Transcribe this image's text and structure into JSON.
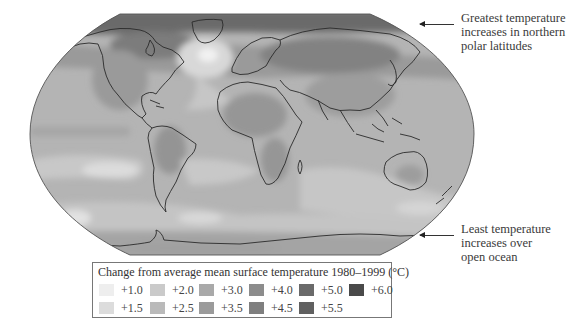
{
  "figure": {
    "type": "world-map",
    "projection": "pseudo-elliptical (flat poles)",
    "colors": {
      "ocean_base": "#b4b4b4",
      "coastline": "#2a2a2a",
      "map_border": "#555555"
    }
  },
  "annotations": {
    "top": {
      "lines": [
        "Greatest temperature",
        "increases in northern",
        "polar latitudes"
      ],
      "arrow": "left-arrow"
    },
    "bottom": {
      "lines": [
        "Least temperature",
        "increases over",
        "open ocean"
      ],
      "arrow": "left-arrow"
    }
  },
  "legend": {
    "title": "Change from average mean surface temperature 1980–1999 (°C)",
    "items": [
      {
        "label": "+1.0",
        "color": "#eeeeee"
      },
      {
        "label": "+1.5",
        "color": "#dcdcdc"
      },
      {
        "label": "+2.0",
        "color": "#cacaca"
      },
      {
        "label": "+2.5",
        "color": "#bababa"
      },
      {
        "label": "+3.0",
        "color": "#a9a9a9"
      },
      {
        "label": "+3.5",
        "color": "#9b9b9b"
      },
      {
        "label": "+4.0",
        "color": "#8c8c8c"
      },
      {
        "label": "+4.5",
        "color": "#7f7f7f"
      },
      {
        "label": "+5.0",
        "color": "#6a6a6a"
      },
      {
        "label": "+5.5",
        "color": "#606060"
      },
      {
        "label": "+6.0",
        "color": "#4a4a4a"
      }
    ]
  },
  "regions": {
    "arctic": "+5.0 to +6.0",
    "north_atlantic_south_of_greenland": "+1.0",
    "continents_interior": "+3.5 to +4.5",
    "tropical_oceans": "+2.5 to +3.0",
    "southern_ocean": "+1.5 to +2.0",
    "antarctica": "+3.0 to +3.5"
  }
}
